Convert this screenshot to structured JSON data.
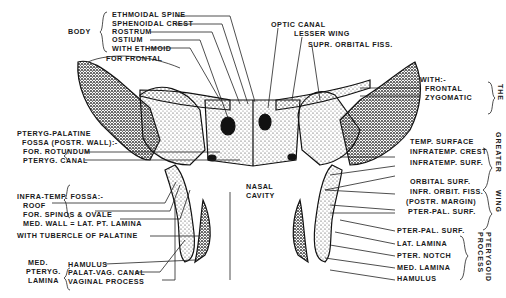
{
  "diagram": {
    "groups": {
      "body": {
        "title": "BODY",
        "items": [
          "ETHMOIDAL SPINE",
          "SPHENOIDAL CREST",
          "ROSTRUM",
          "OSTIUM",
          "WITH ETHMOID"
        ]
      },
      "top_right": [
        "OPTIC CANAL",
        "LESSER WING",
        "SUPR. ORBITAL FISS."
      ],
      "for_frontal": "FOR FRONTAL",
      "the": {
        "title": "THE",
        "header": "WITH:-",
        "items": [
          "FRONTAL",
          "ZYGOMATIC"
        ]
      },
      "greater_wing": {
        "title_top": "GREATER",
        "title_bottom": "WING",
        "items": [
          "TEMP. SURFACE",
          "INFRATEMP. CREST",
          "INFRATEMP. SURF.",
          "ORBITAL SURF.",
          "INFR. ORBIT. FISS.",
          "(POSTR. MARGIN)",
          "PTER-PAL. SURF."
        ]
      },
      "pterygoid_process": {
        "title": "PTERYGOID PROCESS",
        "items": [
          "PTER-PAL. SURF.",
          "LAT. LAMINA",
          "PTER. NOTCH",
          "MED. LAMINA",
          "HAMULUS"
        ]
      },
      "pterygo_palatine": {
        "title_line1": "PTERYG-PALATINE",
        "title_line2": "FOSSA (POSTR. WALL):-",
        "items": [
          "FOR. ROTUNDUM",
          "PTERYG. CANAL"
        ]
      },
      "infra_temp": {
        "title": "INFRA-TEMP. FOSSA:-",
        "items": [
          "ROOF",
          "FOR. SPINOS & OVALE",
          "MED. WALL = LAT. PT. LAMINA"
        ]
      },
      "tubercle": "WITH TUBERCLE OF PALATINE",
      "med_pteryg_lamina": {
        "title": [
          "MED.",
          "PTERYG.",
          "LAMINA"
        ],
        "items": [
          "HAMULUS",
          "PALAT-VAG. CANAL",
          "VAGINAL PROCESS"
        ]
      },
      "center": [
        "NASAL",
        "CAVITY"
      ]
    }
  }
}
